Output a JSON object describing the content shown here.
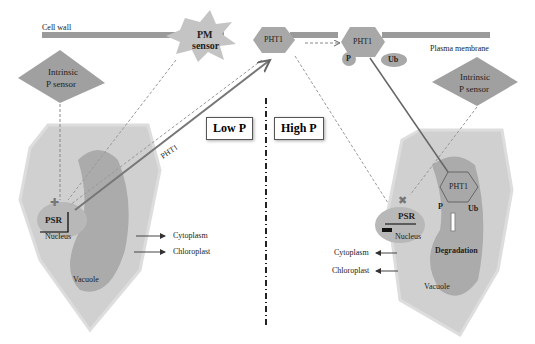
{
  "membrane": {
    "cell_wall": "Cell wall",
    "plasma_membrane": "Plasma membrane"
  },
  "pm_sensor": {
    "line1": "PM",
    "line2": "sensor"
  },
  "transporter": {
    "pht1_left": "PHT1",
    "pht1_right": "PHT1",
    "p_badge": "P",
    "ub_badge": "Ub"
  },
  "conditions": {
    "low": "Low P",
    "high": "High P"
  },
  "left_cell": {
    "sensor_line1": "Intrinsic",
    "sensor_line2": "P sensor",
    "psr": "PSR",
    "nucleus": "Nucleus",
    "vacuole": "Vacuole",
    "cytoplasm": "Cytoplasm",
    "chloroplast": "Chloroplast",
    "arrow_label": "PHT1"
  },
  "right_cell": {
    "sensor_line1": "Intrinsic",
    "sensor_line2": "P sensor",
    "psr": "PSR",
    "nucleus": "Nucleus",
    "vacuole": "Vacuole",
    "cytoplasm": "Cytoplasm",
    "chloroplast": "Chloroplast",
    "pht1": "PHT1",
    "p": "P",
    "ub": "Ub",
    "degradation": "Degradation"
  },
  "colors": {
    "membrane": "#9a9a9a",
    "cell": "#c8c8c8",
    "vacuole": "#a8a8a8",
    "sensor": "#a0a0a0"
  }
}
